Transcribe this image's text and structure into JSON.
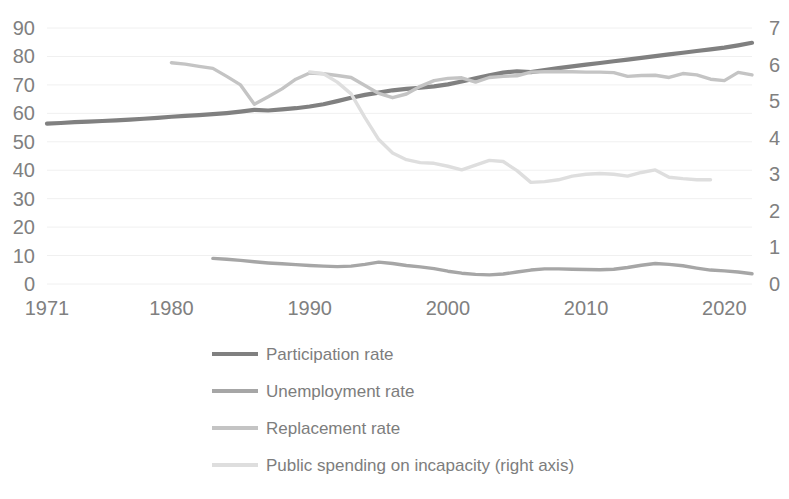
{
  "chart_data": {
    "type": "line",
    "title": "",
    "subtitle": "",
    "xlabel": "",
    "ylabel": "",
    "y2label": "",
    "xlim": [
      1971,
      2022
    ],
    "ylim": [
      0,
      90
    ],
    "y2lim": [
      0,
      7
    ],
    "grid": true,
    "legend_position": "bottom",
    "x_ticks": [
      "1971",
      "1980",
      "1990",
      "2000",
      "2010",
      "2020"
    ],
    "x_tick_values": [
      1971,
      1980,
      1990,
      2000,
      2010,
      2020
    ],
    "y_ticks": [
      "0",
      "10",
      "20",
      "30",
      "40",
      "50",
      "60",
      "70",
      "80",
      "90"
    ],
    "y_tick_values": [
      0,
      10,
      20,
      30,
      40,
      50,
      60,
      70,
      80,
      90
    ],
    "y2_ticks": [
      "0",
      "1",
      "2",
      "3",
      "4",
      "5",
      "6",
      "7"
    ],
    "y2_tick_values": [
      0,
      1,
      2,
      3,
      4,
      5,
      6,
      7
    ],
    "series": [
      {
        "name": "Participation rate",
        "color": "#808080",
        "axis": "left",
        "x": [
          1971,
          1972,
          1973,
          1974,
          1975,
          1976,
          1977,
          1978,
          1979,
          1980,
          1981,
          1982,
          1983,
          1984,
          1985,
          1986,
          1987,
          1988,
          1989,
          1990,
          1991,
          1992,
          1993,
          1994,
          1995,
          1996,
          1997,
          1998,
          1999,
          2000,
          2001,
          2002,
          2003,
          2004,
          2005,
          2006,
          2007,
          2008,
          2009,
          2010,
          2011,
          2012,
          2013,
          2014,
          2015,
          2016,
          2017,
          2018,
          2019,
          2020,
          2021,
          2022
        ],
        "values": [
          56.4,
          56.6,
          56.9,
          57.1,
          57.3,
          57.5,
          57.8,
          58.1,
          58.4,
          58.8,
          59.1,
          59.4,
          59.7,
          60.1,
          60.6,
          61.2,
          61.0,
          61.4,
          61.8,
          62.4,
          63.2,
          64.3,
          65.5,
          66.5,
          67.3,
          68.1,
          68.6,
          69.0,
          69.5,
          70.2,
          71.2,
          72.3,
          73.4,
          74.3,
          74.8,
          74.5,
          75.2,
          75.9,
          76.5,
          77.1,
          77.7,
          78.3,
          78.9,
          79.5,
          80.1,
          80.7,
          81.3,
          81.9,
          82.5,
          83.1,
          83.9,
          84.8
        ]
      },
      {
        "name": "Unemployment rate",
        "color": "#a6a6a6",
        "axis": "left",
        "x": [
          1983,
          1984,
          1985,
          1986,
          1987,
          1988,
          1989,
          1990,
          1991,
          1992,
          1993,
          1994,
          1995,
          1996,
          1997,
          1998,
          1999,
          2000,
          2001,
          2002,
          2003,
          2004,
          2005,
          2006,
          2007,
          2008,
          2009,
          2010,
          2011,
          2012,
          2013,
          2014,
          2015,
          2016,
          2017,
          2018,
          2019,
          2020,
          2021,
          2022
        ],
        "values": [
          9.0,
          8.7,
          8.3,
          7.8,
          7.4,
          7.1,
          6.8,
          6.5,
          6.3,
          6.1,
          6.3,
          6.9,
          7.7,
          7.2,
          6.5,
          6.0,
          5.4,
          4.5,
          3.8,
          3.4,
          3.2,
          3.5,
          4.2,
          4.9,
          5.3,
          5.3,
          5.2,
          5.1,
          5.0,
          5.2,
          5.8,
          6.6,
          7.2,
          6.9,
          6.4,
          5.6,
          4.9,
          4.6,
          4.2,
          3.6
        ]
      },
      {
        "name": "Replacement rate",
        "color": "#c4c4c4",
        "axis": "left",
        "x": [
          1980,
          1981,
          1982,
          1983,
          1984,
          1985,
          1986,
          1987,
          1988,
          1989,
          1990,
          1991,
          1992,
          1993,
          1994,
          1995,
          1996,
          1997,
          1998,
          1999,
          2000,
          2001,
          2002,
          2003,
          2004,
          2005,
          2006,
          2007,
          2008,
          2009,
          2010,
          2011,
          2012,
          2013,
          2014,
          2015,
          2016,
          2017,
          2018,
          2019,
          2020,
          2021,
          2022
        ],
        "values": [
          77.8,
          77.3,
          76.5,
          75.8,
          73.0,
          70.0,
          63.2,
          65.8,
          68.6,
          72.0,
          74.2,
          73.9,
          73.3,
          72.6,
          69.8,
          67.0,
          65.5,
          66.8,
          69.5,
          71.5,
          72.3,
          72.5,
          71.0,
          72.6,
          73.0,
          73.2,
          74.5,
          74.6,
          74.7,
          74.6,
          74.5,
          74.5,
          74.3,
          73.0,
          73.3,
          73.4,
          72.6,
          74.0,
          73.5,
          72.0,
          71.5,
          74.4,
          73.5
        ]
      },
      {
        "name": "Public spending on incapacity (right axis)",
        "color": "#dedede",
        "axis": "right",
        "x": [
          1990,
          1991,
          1992,
          1993,
          1994,
          1995,
          1996,
          1997,
          1998,
          1999,
          2000,
          2001,
          2002,
          2003,
          2004,
          2005,
          2006,
          2007,
          2008,
          2009,
          2010,
          2011,
          2012,
          2013,
          2014,
          2015,
          2016,
          2017,
          2018,
          2019
        ],
        "values": [
          5.8,
          5.75,
          5.52,
          5.2,
          4.55,
          3.95,
          3.58,
          3.4,
          3.32,
          3.3,
          3.22,
          3.12,
          3.25,
          3.38,
          3.35,
          3.1,
          2.78,
          2.8,
          2.85,
          2.95,
          3.0,
          3.02,
          3.0,
          2.95,
          3.05,
          3.12,
          2.92,
          2.88,
          2.85,
          2.85
        ]
      }
    ]
  },
  "legend": {
    "items": [
      {
        "label": "Participation rate",
        "color": "#808080"
      },
      {
        "label": "Unemployment rate",
        "color": "#a6a6a6"
      },
      {
        "label": "Replacement rate",
        "color": "#c4c4c4"
      },
      {
        "label": "Public spending on incapacity (right axis)",
        "color": "#dedede"
      }
    ]
  },
  "style": {
    "grid_color": "#f0f0f0",
    "tick_text_color": "#808080",
    "legend_text_color": "#7d7d7d",
    "background": "#ffffff"
  }
}
